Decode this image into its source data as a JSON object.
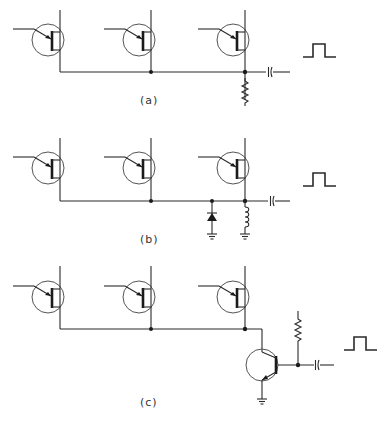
{
  "figure": {
    "panels": [
      {
        "id": "a",
        "label": "(a)",
        "load": "resistor",
        "transistors": 3
      },
      {
        "id": "b",
        "label": "(b)",
        "load": "diode and inductor",
        "transistors": 3
      },
      {
        "id": "c",
        "label": "(c)",
        "load": "output transistor with collector resistor",
        "transistors": 4
      }
    ],
    "output_waveform": "single rectangular pulse"
  }
}
